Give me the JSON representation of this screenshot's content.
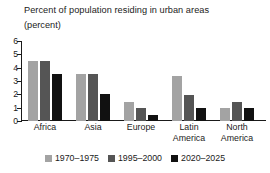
{
  "chart_data": {
    "type": "bar",
    "title": "Percent of population residing in urban areas",
    "subtitle": "(percent)",
    "xlabel": "",
    "ylabel": "",
    "ylim": [
      0,
      6
    ],
    "ytick_labels": [
      "6",
      "5",
      "4",
      "3",
      "2",
      "1",
      "0"
    ],
    "ytick_values": [
      6,
      5,
      4,
      3,
      2,
      1,
      0
    ],
    "grid": false,
    "legend_position": "bottom",
    "categories": [
      "Africa",
      "Asia",
      "Europe",
      "Latin\nAmerica",
      "North\nAmerica"
    ],
    "series": [
      {
        "name": "1970–1975",
        "color": "#a3a3a3",
        "values": [
          4.5,
          3.5,
          1.45,
          3.4,
          0.95
        ]
      },
      {
        "name": "1995–2000",
        "color": "#555555",
        "values": [
          4.5,
          3.5,
          1.0,
          1.95,
          1.45
        ]
      },
      {
        "name": "2020–2025",
        "color": "#111111",
        "values": [
          3.5,
          2.0,
          0.45,
          0.95,
          0.95
        ]
      }
    ]
  }
}
